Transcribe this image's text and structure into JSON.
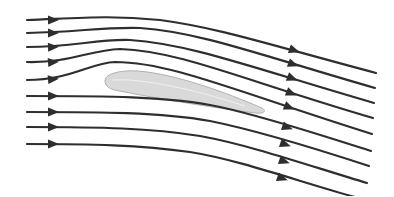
{
  "diagram": {
    "title": "",
    "colors": {
      "background": "#ffffff",
      "streamline": "#2e2e2e",
      "airfoil_fill": "#d9d9d9",
      "airfoil_stroke": "#b0b0b0"
    },
    "airfoil": {
      "path": "M105,82 C104,74 118,70 138,71 C175,74 225,92 262,108 C267,111 264,114 256,113 C215,108 160,99 125,92 C112,90 106,88 105,82 Z",
      "highlight": "M112,80 C140,78 190,88 245,106"
    },
    "streamlines": [
      {
        "path": "M27,20 C80,18 110,15 160,20 C220,28 270,45 376,73",
        "arrow_left": [
          55,
          20,
          0
        ],
        "arrow_right": [
          296,
          51,
          19
        ]
      },
      {
        "path": "M27,33 C80,32 100,27 140,28 C200,32 260,55 375,88",
        "arrow_left": [
          55,
          33,
          0
        ],
        "arrow_right": [
          295,
          65,
          20
        ]
      },
      {
        "path": "M27,47 C75,47 95,39 130,40 C190,44 250,67 374,103",
        "arrow_left": [
          55,
          47,
          -2
        ],
        "arrow_right": [
          294,
          79,
          21
        ]
      },
      {
        "path": "M27,62 C70,63 90,50 120,49 C180,51 240,79 373,118",
        "arrow_left": [
          55,
          62,
          -4
        ],
        "arrow_right": [
          293,
          94,
          22
        ]
      },
      {
        "path": "M27,80 C70,80 90,63 115,62 C170,62 235,91 372,134",
        "arrow_left": [
          55,
          79,
          -5
        ],
        "arrow_right": [
          291,
          108,
          22
        ]
      },
      {
        "path": "M27,96 C100,96 170,96 220,107 C270,118 320,135 371,151",
        "arrow_left": [
          55,
          96,
          0
        ],
        "arrow_right": [
          289,
          128,
          19
        ]
      },
      {
        "path": "M27,112 C100,112 160,112 210,121 C260,131 320,150 369,166",
        "arrow_left": [
          55,
          112,
          0
        ],
        "arrow_right": [
          287,
          145,
          19
        ]
      },
      {
        "path": "M27,127 C100,127 150,128 200,136 C250,145 310,166 367,183",
        "arrow_left": [
          55,
          127,
          0
        ],
        "arrow_right": [
          286,
          162,
          19
        ]
      },
      {
        "path": "M27,144 C90,144 140,145 190,152 C240,160 300,182 355,197",
        "arrow_left": [
          55,
          144,
          0
        ],
        "arrow_right": [
          284,
          179,
          19
        ]
      }
    ]
  }
}
